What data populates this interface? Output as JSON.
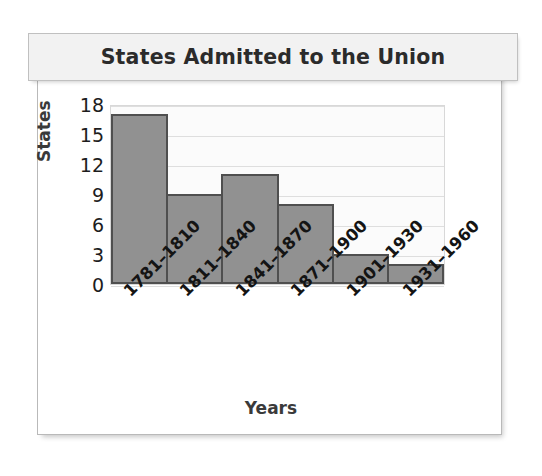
{
  "chart_data": {
    "type": "bar",
    "title": "States Admitted to the Union",
    "xlabel": "Years",
    "ylabel": "States",
    "categories": [
      "1781–1810",
      "1811–1840",
      "1841–1870",
      "1871–1900",
      "1901–1930",
      "1931–1960"
    ],
    "values": [
      17,
      9,
      11,
      8,
      3,
      2
    ],
    "ylim": [
      0,
      18
    ],
    "yticks": [
      0,
      3,
      6,
      9,
      12,
      15,
      18
    ],
    "ytick_labels": [
      "0",
      "3",
      "6",
      "9",
      "12",
      "15",
      "18"
    ],
    "grid": "horizontal",
    "legend": "none",
    "bar_style": "contiguous-histogram",
    "colors": {
      "bar_fill": "#919191",
      "bar_border": "#4f4f4f",
      "plot_background": "#fbfbfb",
      "gridline": "#dedede",
      "title_background": "#f2f2f2",
      "title_text": "#2b2b2b",
      "axis_title_text": "#3a3a3a",
      "tick_text": "#1d1d1d",
      "frame_border": "#b9b9b9"
    }
  }
}
